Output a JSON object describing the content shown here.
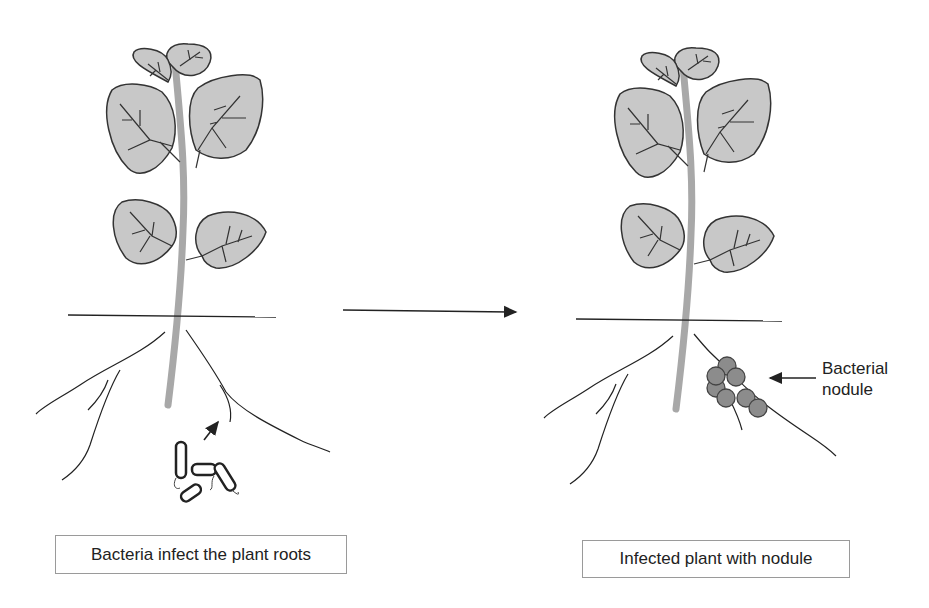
{
  "diagram": {
    "left_panel": {
      "caption": "Bacteria infect the plant roots",
      "elements": [
        "plant",
        "soil-line",
        "roots",
        "bacteria",
        "arrow-to-root"
      ]
    },
    "right_panel": {
      "caption": "Infected plant with nodule",
      "nodule_label_line1": "Bacterial",
      "nodule_label_line2": "nodule",
      "elements": [
        "plant",
        "soil-line",
        "roots",
        "nodule-cluster",
        "label-arrow"
      ]
    },
    "transition_arrow": "process-arrow",
    "colors": {
      "leaf_fill": "#c8c8c8",
      "stem": "#a8a8a8",
      "outline": "#333333",
      "nodule_fill": "#8c8c8c",
      "caption_border": "#9a9a9a"
    }
  }
}
